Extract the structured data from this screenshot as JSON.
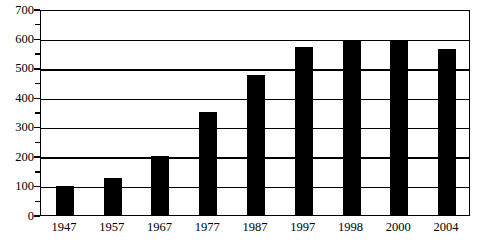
{
  "chart_data": {
    "type": "bar",
    "title": "",
    "xlabel": "",
    "ylabel": "",
    "categories": [
      "1947",
      "1957",
      "1967",
      "1977",
      "1987",
      "1997",
      "1998",
      "2000",
      "2004"
    ],
    "values": [
      100,
      125,
      200,
      350,
      475,
      572,
      595,
      590,
      565
    ],
    "ylim": [
      0,
      700
    ],
    "ytick_labels": [
      "0",
      "100",
      "200",
      "300",
      "400",
      "500",
      "600",
      "700"
    ],
    "ytick_values": [
      0,
      100,
      200,
      300,
      400,
      500,
      600,
      700
    ],
    "yminor_values": [
      50,
      150,
      250,
      350,
      450,
      550,
      650
    ],
    "ytick_step": 100,
    "yminor_step": 50,
    "grid": true,
    "grid_axis": "y",
    "legend": null,
    "bar_color": "#000000",
    "axis_color": "#000000",
    "background_color": "#ffffff"
  }
}
